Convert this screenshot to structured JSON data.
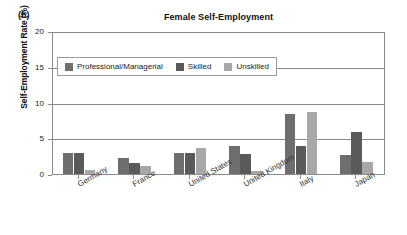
{
  "panel": {
    "label": "(b)"
  },
  "chart_data": {
    "type": "bar",
    "title": "Female Self-Employment",
    "xlabel": "",
    "ylabel": "Self-Employment Rate (%)",
    "ylim": [
      0,
      20
    ],
    "yticks": [
      0,
      5,
      10,
      15,
      20
    ],
    "ytick_labels": [
      "0",
      "5",
      "10",
      "15",
      "20"
    ],
    "grid": true,
    "legend_position": "upper-left-inside",
    "categories": [
      "Germany",
      "France",
      "United States",
      "United Kingdom",
      "Italy",
      "Japan"
    ],
    "series": [
      {
        "name": "Professional/Managerial",
        "color": "#6e6e6e",
        "values": [
          2.9,
          2.2,
          3.0,
          3.9,
          8.4,
          2.6
        ]
      },
      {
        "name": "Skilled",
        "color": "#5a5a5a",
        "values": [
          2.9,
          1.6,
          2.9,
          2.8,
          3.9,
          5.9
        ]
      },
      {
        "name": "Unskilled",
        "color": "#a8a8a8",
        "values": [
          0.6,
          1.1,
          3.7,
          0.4,
          8.7,
          1.7
        ]
      }
    ]
  }
}
